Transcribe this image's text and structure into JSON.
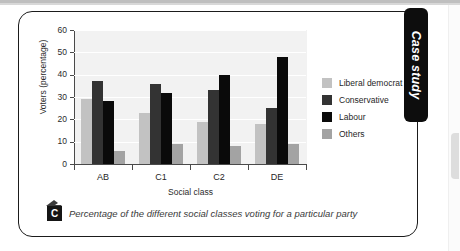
{
  "tab": {
    "label": "Case study"
  },
  "caption": {
    "badge": "C",
    "text": "Percentage of the different social classes voting for a particular party"
  },
  "chart_data": {
    "type": "bar",
    "title": "",
    "xlabel": "Social class",
    "ylabel": "Voters (percentage)",
    "categories": [
      "AB",
      "C1",
      "C2",
      "DE"
    ],
    "ylim": [
      0,
      60
    ],
    "yticks": [
      0,
      10,
      20,
      30,
      40,
      50,
      60
    ],
    "grid": true,
    "legend_position": "right",
    "series": [
      {
        "name": "Liberal democrat",
        "color": "#c2c2c2",
        "values": [
          29,
          23,
          19,
          18
        ]
      },
      {
        "name": "Conservative",
        "color": "#333333",
        "values": [
          37,
          36,
          33,
          25
        ]
      },
      {
        "name": "Labour",
        "color": "#0a0a0a",
        "values": [
          28,
          32,
          40,
          48
        ]
      },
      {
        "name": "Others",
        "color": "#a3a3a3",
        "values": [
          6,
          9,
          8,
          9
        ]
      }
    ]
  }
}
